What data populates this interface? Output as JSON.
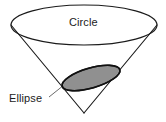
{
  "figure": {
    "background_color": "#ffffff",
    "stroke_color": "#1b1b1b",
    "hatch_color": "#222222",
    "width": 166,
    "height": 122
  },
  "labels": {
    "circle": "Circle",
    "ellipse": "Ellipse"
  },
  "shapes": {
    "cone": {
      "name": "cone",
      "apex": {
        "x": 84,
        "y": 113
      },
      "rim_center": {
        "x": 84,
        "y": 25
      },
      "rim_rx": 73,
      "rim_ry": 20,
      "left_edge": {
        "x": 11,
        "y": 25
      },
      "right_edge": {
        "x": 157,
        "y": 25
      }
    },
    "circle_rim": {
      "name": "circle",
      "cx": 84,
      "cy": 25,
      "rx": 73,
      "ry": 20,
      "filled": false
    },
    "ellipse_section": {
      "name": "ellipse",
      "cx": 91,
      "cy": 78,
      "rx": 30,
      "ry": 10,
      "rotation_deg": -16,
      "fill": "hatched",
      "hatch_direction": "horizontal"
    },
    "leader_line": {
      "name": "ellipse-leader-line",
      "from": {
        "x": 49,
        "y": 97
      },
      "to": {
        "x": 64,
        "y": 85
      }
    }
  }
}
